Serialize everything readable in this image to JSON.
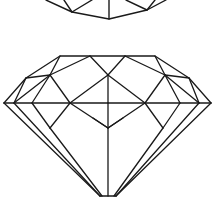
{
  "image": {
    "subject": "line drawing of brilliant-cut diamonds",
    "background": "#ffffff",
    "stroke_color": "#1a1a1a",
    "figures": [
      "partial-diamond-pavilion-top",
      "diamond-side-view"
    ]
  }
}
